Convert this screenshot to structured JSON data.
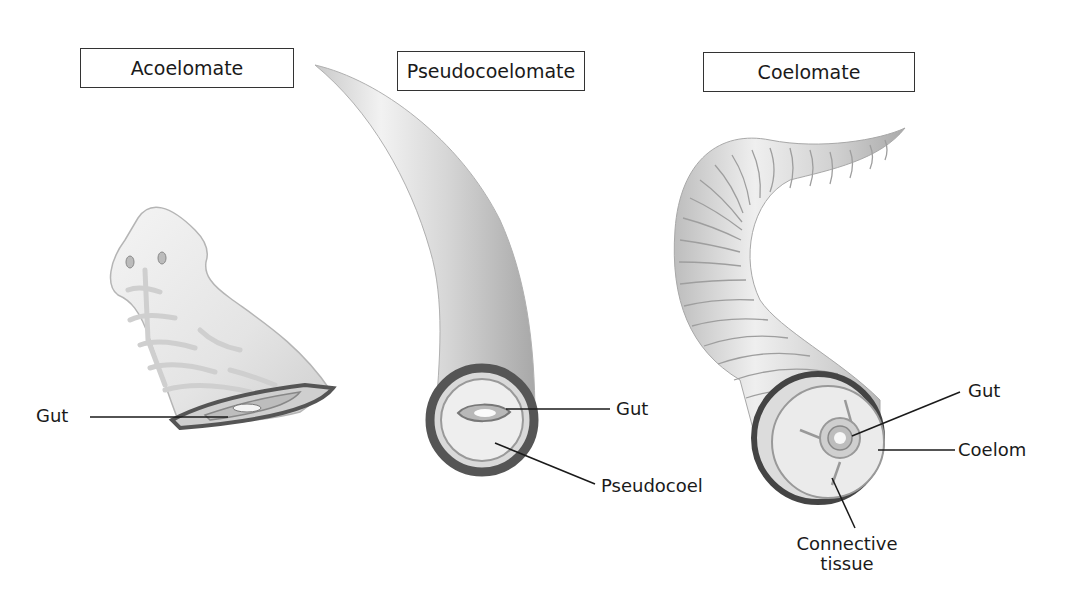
{
  "diagram": {
    "panels": [
      {
        "id": "acoelomate",
        "title": "Acoelomate",
        "organism": "flatworm",
        "labels": [
          {
            "text": "Gut",
            "target": "gut"
          }
        ]
      },
      {
        "id": "pseudocoelomate",
        "title": "Pseudocoelomate",
        "organism": "roundworm",
        "labels": [
          {
            "text": "Gut",
            "target": "gut"
          },
          {
            "text": "Pseudocoel",
            "target": "pseudocoel"
          }
        ]
      },
      {
        "id": "coelomate",
        "title": "Coelomate",
        "organism": "earthworm",
        "labels": [
          {
            "text": "Gut",
            "target": "gut"
          },
          {
            "text": "Coelom",
            "target": "coelom"
          },
          {
            "text": "Connective tissue",
            "line1": "Connective",
            "line2": "tissue",
            "target": "connective-tissue"
          }
        ]
      }
    ],
    "colors": {
      "outline": "#333333",
      "body_fill": "#e6e6e6",
      "body_shadow": "#bdbdbd",
      "wall_dark": "#555555",
      "leader_line": "#1a1a1a"
    }
  }
}
